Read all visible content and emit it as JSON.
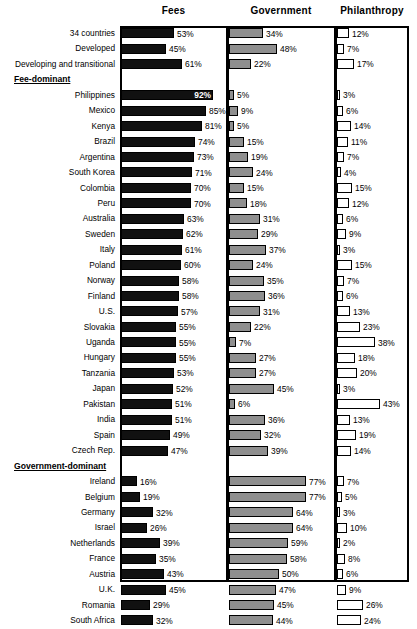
{
  "chart_data": {
    "type": "bar",
    "title": "",
    "subtitle": "",
    "xlabel": "",
    "ylabel": "",
    "xlim": [
      0,
      100
    ],
    "grid": false,
    "legend_position": "none",
    "orientation": "horizontal",
    "value_suffix": "%",
    "panels": [
      {
        "key": "fees",
        "label": "Fees",
        "color": "#111111"
      },
      {
        "key": "government",
        "label": "Government",
        "color": "#8f8f8f"
      },
      {
        "key": "philanthropy",
        "label": "Philanthropy",
        "color": "#ffffff"
      }
    ],
    "categories": [
      "34 countries",
      "Developed",
      "Developing and transitional",
      "Philippines",
      "Mexico",
      "Kenya",
      "Brazil",
      "Argentina",
      "South Korea",
      "Colombia",
      "Peru",
      "Australia",
      "Sweden",
      "Italy",
      "Poland",
      "Norway",
      "Finland",
      "U.S.",
      "Slovakia",
      "Uganda",
      "Hungary",
      "Tanzania",
      "Japan",
      "Pakistan",
      "India",
      "Spain",
      "Czech Rep.",
      "Ireland",
      "Belgium",
      "Germany",
      "Israel",
      "Netherlands",
      "France",
      "Austria",
      "U.K.",
      "Romania",
      "South Africa"
    ],
    "series": [
      {
        "name": "Fees",
        "values": [
          53,
          45,
          61,
          92,
          85,
          81,
          74,
          73,
          71,
          70,
          70,
          63,
          62,
          61,
          60,
          58,
          58,
          57,
          55,
          55,
          55,
          53,
          52,
          51,
          51,
          49,
          47,
          16,
          19,
          32,
          26,
          39,
          35,
          43,
          45,
          29,
          32
        ]
      },
      {
        "name": "Government",
        "values": [
          34,
          48,
          22,
          5,
          9,
          5,
          15,
          19,
          24,
          15,
          18,
          31,
          29,
          37,
          24,
          35,
          36,
          31,
          22,
          7,
          27,
          27,
          45,
          6,
          36,
          32,
          39,
          77,
          77,
          64,
          64,
          59,
          58,
          50,
          47,
          45,
          44
        ]
      },
      {
        "name": "Philanthropy",
        "values": [
          12,
          7,
          17,
          3,
          6,
          14,
          11,
          7,
          4,
          15,
          12,
          6,
          9,
          3,
          15,
          7,
          6,
          13,
          23,
          38,
          18,
          20,
          3,
          43,
          13,
          19,
          14,
          7,
          5,
          3,
          10,
          2,
          8,
          6,
          9,
          26,
          24
        ]
      }
    ],
    "group_headings": [
      {
        "label": "Fee-dominant",
        "after_category": "Developing and transitional"
      },
      {
        "label": "Government-dominant",
        "after_category": "Czech Rep."
      }
    ]
  },
  "rows": [
    {
      "type": "data",
      "label": "34 countries",
      "fees": 53,
      "government": 34,
      "philanthropy": 12
    },
    {
      "type": "data",
      "label": "Developed",
      "fees": 45,
      "government": 48,
      "philanthropy": 7
    },
    {
      "type": "data",
      "label": "Developing and transitional",
      "fees": 61,
      "government": 22,
      "philanthropy": 17
    },
    {
      "type": "group",
      "label": "Fee-dominant"
    },
    {
      "type": "data",
      "label": "Philippines",
      "fees": 92,
      "government": 5,
      "philanthropy": 3
    },
    {
      "type": "data",
      "label": "Mexico",
      "fees": 85,
      "government": 9,
      "philanthropy": 6
    },
    {
      "type": "data",
      "label": "Kenya",
      "fees": 81,
      "government": 5,
      "philanthropy": 14
    },
    {
      "type": "data",
      "label": "Brazil",
      "fees": 74,
      "government": 15,
      "philanthropy": 11
    },
    {
      "type": "data",
      "label": "Argentina",
      "fees": 73,
      "government": 19,
      "philanthropy": 7
    },
    {
      "type": "data",
      "label": "South Korea",
      "fees": 71,
      "government": 24,
      "philanthropy": 4
    },
    {
      "type": "data",
      "label": "Colombia",
      "fees": 70,
      "government": 15,
      "philanthropy": 15
    },
    {
      "type": "data",
      "label": "Peru",
      "fees": 70,
      "government": 18,
      "philanthropy": 12
    },
    {
      "type": "data",
      "label": "Australia",
      "fees": 63,
      "government": 31,
      "philanthropy": 6
    },
    {
      "type": "data",
      "label": "Sweden",
      "fees": 62,
      "government": 29,
      "philanthropy": 9
    },
    {
      "type": "data",
      "label": "Italy",
      "fees": 61,
      "government": 37,
      "philanthropy": 3
    },
    {
      "type": "data",
      "label": "Poland",
      "fees": 60,
      "government": 24,
      "philanthropy": 15
    },
    {
      "type": "data",
      "label": "Norway",
      "fees": 58,
      "government": 35,
      "philanthropy": 7
    },
    {
      "type": "data",
      "label": "Finland",
      "fees": 58,
      "government": 36,
      "philanthropy": 6
    },
    {
      "type": "data",
      "label": "U.S.",
      "fees": 57,
      "government": 31,
      "philanthropy": 13
    },
    {
      "type": "data",
      "label": "Slovakia",
      "fees": 55,
      "government": 22,
      "philanthropy": 23
    },
    {
      "type": "data",
      "label": "Uganda",
      "fees": 55,
      "government": 7,
      "philanthropy": 38
    },
    {
      "type": "data",
      "label": "Hungary",
      "fees": 55,
      "government": 27,
      "philanthropy": 18
    },
    {
      "type": "data",
      "label": "Tanzania",
      "fees": 53,
      "government": 27,
      "philanthropy": 20
    },
    {
      "type": "data",
      "label": "Japan",
      "fees": 52,
      "government": 45,
      "philanthropy": 3
    },
    {
      "type": "data",
      "label": "Pakistan",
      "fees": 51,
      "government": 6,
      "philanthropy": 43
    },
    {
      "type": "data",
      "label": "India",
      "fees": 51,
      "government": 36,
      "philanthropy": 13
    },
    {
      "type": "data",
      "label": "Spain",
      "fees": 49,
      "government": 32,
      "philanthropy": 19
    },
    {
      "type": "data",
      "label": "Czech Rep.",
      "fees": 47,
      "government": 39,
      "philanthropy": 14
    },
    {
      "type": "group",
      "label": "Government-dominant"
    },
    {
      "type": "data",
      "label": "Ireland",
      "fees": 16,
      "government": 77,
      "philanthropy": 7
    },
    {
      "type": "data",
      "label": "Belgium",
      "fees": 19,
      "government": 77,
      "philanthropy": 5
    },
    {
      "type": "data",
      "label": "Germany",
      "fees": 32,
      "government": 64,
      "philanthropy": 3
    },
    {
      "type": "data",
      "label": "Israel",
      "fees": 26,
      "government": 64,
      "philanthropy": 10
    },
    {
      "type": "data",
      "label": "Netherlands",
      "fees": 39,
      "government": 59,
      "philanthropy": 2
    },
    {
      "type": "data",
      "label": "France",
      "fees": 35,
      "government": 58,
      "philanthropy": 8
    },
    {
      "type": "data",
      "label": "Austria",
      "fees": 43,
      "government": 50,
      "philanthropy": 6
    },
    {
      "type": "data",
      "label": "U.K.",
      "fees": 45,
      "government": 47,
      "philanthropy": 9
    },
    {
      "type": "data",
      "label": "Romania",
      "fees": 29,
      "government": 45,
      "philanthropy": 26
    },
    {
      "type": "data",
      "label": "South Africa",
      "fees": 32,
      "government": 44,
      "philanthropy": 24
    }
  ],
  "headers": {
    "fees": "Fees",
    "government": "Government",
    "philanthropy": "Philanthropy"
  }
}
